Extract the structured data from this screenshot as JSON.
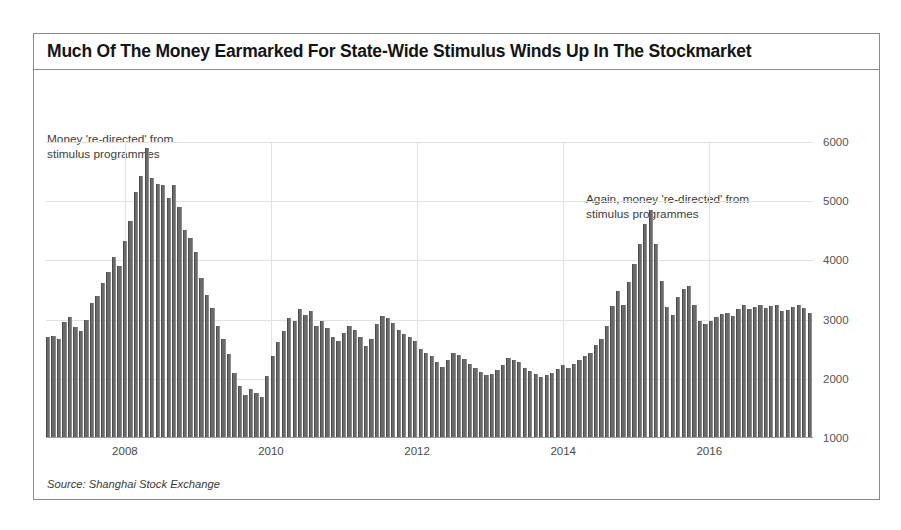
{
  "figure": {
    "title": "Much Of The Money Earmarked For State-Wide Stimulus Winds Up In The Stockmarket",
    "source": "Source: Shanghai Stock Exchange",
    "artifact_mark": "t.",
    "frame_color": "#8a8a8a",
    "bar_color": "#6a6a6a",
    "grid_color": "#e2e2e2"
  },
  "annotations": {
    "first": "Money 're-directed' from\nstimulus programmes",
    "second": "Again, money 're-directed' from\nstimulus programmes"
  },
  "chart_data": {
    "type": "bar",
    "title": "Much Of The Money Earmarked For State-Wide Stimulus Winds Up In The Stockmarket",
    "xlabel": "",
    "ylabel": "",
    "ylim": [
      1000,
      6000
    ],
    "yticks": [
      1000,
      2000,
      3000,
      4000,
      5000,
      6000
    ],
    "ytick_labels": [
      "1000",
      "2000",
      "3000",
      "4000",
      "5000",
      "6000"
    ],
    "xticks": [
      2008,
      2010,
      2012,
      2014,
      2016
    ],
    "xtick_labels": [
      "2008",
      "2010",
      "2012",
      "2014",
      "2016"
    ],
    "grid": true,
    "legend": "none",
    "series_name": "Shanghai Composite Index (monthly)",
    "x_start": 2006.92,
    "x_end": 2017.42,
    "values": [
      2700,
      2730,
      2680,
      2960,
      3040,
      2880,
      2800,
      3000,
      3280,
      3400,
      3620,
      3800,
      4050,
      3900,
      4320,
      4670,
      5150,
      5420,
      5900,
      5400,
      5290,
      5270,
      5050,
      5280,
      4900,
      4520,
      4380,
      4150,
      3700,
      3420,
      3200,
      2900,
      2680,
      2420,
      2100,
      1880,
      1730,
      1820,
      1760,
      1700,
      2050,
      2380,
      2620,
      2800,
      3020,
      2980,
      3180,
      3080,
      3140,
      2900,
      2980,
      2860,
      2700,
      2640,
      2780,
      2900,
      2820,
      2700,
      2560,
      2680,
      2920,
      3060,
      3030,
      2940,
      2830,
      2760,
      2700,
      2640,
      2500,
      2430,
      2380,
      2290,
      2200,
      2320,
      2430,
      2400,
      2330,
      2250,
      2180,
      2120,
      2060,
      2080,
      2150,
      2230,
      2350,
      2320,
      2280,
      2190,
      2140,
      2080,
      2030,
      2060,
      2100,
      2160,
      2230,
      2190,
      2250,
      2320,
      2390,
      2440,
      2570,
      2680,
      2900,
      3230,
      3480,
      3240,
      3630,
      3940,
      4280,
      4620,
      4850,
      4270,
      3660,
      3210,
      3080,
      3380,
      3520,
      3560,
      3240,
      2970,
      2920,
      2980,
      3040,
      3100,
      3120,
      3060,
      3180,
      3250,
      3180,
      3220,
      3240,
      3190,
      3230,
      3250,
      3140,
      3170,
      3220,
      3250,
      3190,
      3120
    ]
  }
}
